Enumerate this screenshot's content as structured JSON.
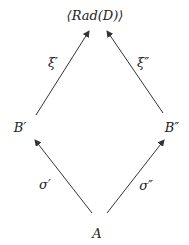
{
  "diagram": {
    "type": "commutative-diagram",
    "nodes": {
      "top": {
        "label": "⟨Rad(D)⟩",
        "x": 95,
        "y": 15
      },
      "left": {
        "label": "B′",
        "x": 20,
        "y": 127
      },
      "right": {
        "label": "B″",
        "x": 172,
        "y": 127
      },
      "bottom": {
        "label": "A",
        "x": 97,
        "y": 233
      }
    },
    "edges": {
      "xi_prime": {
        "label": "ξ′",
        "from": "left",
        "to": "top",
        "lx": 53,
        "ly": 62
      },
      "xi_double_prime": {
        "label": "ξ″",
        "from": "right",
        "to": "top",
        "lx": 143,
        "ly": 62
      },
      "sigma_prime": {
        "label": "σ′",
        "from": "bottom",
        "to": "left",
        "lx": 45,
        "ly": 184
      },
      "sigma_double_prime": {
        "label": "σ″",
        "from": "bottom",
        "to": "right",
        "lx": 146,
        "ly": 185
      }
    },
    "colors": {
      "line": "#333333",
      "text": "#222222"
    }
  }
}
